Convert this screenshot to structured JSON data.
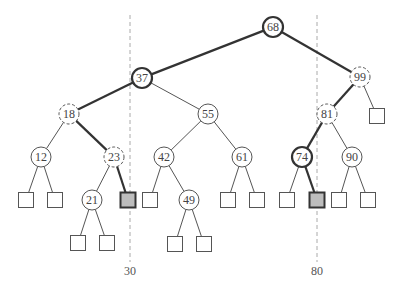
{
  "diagram": {
    "type": "binary-search-tree-range-query",
    "query_range": {
      "low": "30",
      "high": "80"
    },
    "split_lines": [
      {
        "id": "low",
        "x": 130,
        "label": "30"
      },
      {
        "id": "high",
        "x": 317,
        "label": "80"
      }
    ],
    "nodes": [
      {
        "id": "n68",
        "label": "68",
        "x": 273,
        "y": 27,
        "style": "thick"
      },
      {
        "id": "n37",
        "label": "37",
        "x": 142,
        "y": 78,
        "style": "thick"
      },
      {
        "id": "n99",
        "label": "99",
        "x": 360,
        "y": 77,
        "style": "dashed"
      },
      {
        "id": "n18",
        "label": "18",
        "x": 69,
        "y": 114,
        "style": "dashed"
      },
      {
        "id": "n55",
        "label": "55",
        "x": 208,
        "y": 114,
        "style": "normal"
      },
      {
        "id": "n81",
        "label": "81",
        "x": 327,
        "y": 114,
        "style": "dashed"
      },
      {
        "id": "n12",
        "label": "12",
        "x": 41,
        "y": 157,
        "style": "normal"
      },
      {
        "id": "n23",
        "label": "23",
        "x": 114,
        "y": 157,
        "style": "dashed"
      },
      {
        "id": "n42",
        "label": "42",
        "x": 164,
        "y": 157,
        "style": "normal"
      },
      {
        "id": "n61",
        "label": "61",
        "x": 242,
        "y": 157,
        "style": "normal"
      },
      {
        "id": "n74",
        "label": "74",
        "x": 302,
        "y": 157,
        "style": "thick"
      },
      {
        "id": "n90",
        "label": "90",
        "x": 352,
        "y": 157,
        "style": "normal"
      },
      {
        "id": "n21",
        "label": "21",
        "x": 92,
        "y": 200,
        "style": "normal"
      },
      {
        "id": "n49",
        "label": "49",
        "x": 189,
        "y": 200,
        "style": "normal"
      }
    ],
    "leaves": [
      {
        "id": "l99r",
        "x": 377,
        "y": 116,
        "shaded": false
      },
      {
        "id": "l12a",
        "x": 26,
        "y": 200,
        "shaded": false
      },
      {
        "id": "l12b",
        "x": 55,
        "y": 200,
        "shaded": false
      },
      {
        "id": "l23r",
        "x": 128,
        "y": 200,
        "shaded": true
      },
      {
        "id": "l42a",
        "x": 150,
        "y": 200,
        "shaded": false
      },
      {
        "id": "l61a",
        "x": 228,
        "y": 200,
        "shaded": false
      },
      {
        "id": "l61b",
        "x": 257,
        "y": 200,
        "shaded": false
      },
      {
        "id": "l74a",
        "x": 287,
        "y": 200,
        "shaded": false
      },
      {
        "id": "l74b",
        "x": 317,
        "y": 200,
        "shaded": true
      },
      {
        "id": "l90a",
        "x": 339,
        "y": 200,
        "shaded": false
      },
      {
        "id": "l90b",
        "x": 368,
        "y": 200,
        "shaded": false
      },
      {
        "id": "l21a",
        "x": 78,
        "y": 243,
        "shaded": false
      },
      {
        "id": "l21b",
        "x": 107,
        "y": 243,
        "shaded": false
      },
      {
        "id": "l49a",
        "x": 175,
        "y": 244,
        "shaded": false
      },
      {
        "id": "l49b",
        "x": 204,
        "y": 244,
        "shaded": false
      }
    ],
    "edges": [
      {
        "from": "n68",
        "to": "n37",
        "thick": true
      },
      {
        "from": "n68",
        "to": "n99",
        "thick": true
      },
      {
        "from": "n37",
        "to": "n18",
        "thick": true
      },
      {
        "from": "n37",
        "to": "n55",
        "thick": false
      },
      {
        "from": "n99",
        "to": "n81",
        "thick": true
      },
      {
        "from": "n99",
        "to": "l99r",
        "thick": false
      },
      {
        "from": "n18",
        "to": "n12",
        "thick": false
      },
      {
        "from": "n18",
        "to": "n23",
        "thick": true
      },
      {
        "from": "n55",
        "to": "n42",
        "thick": false
      },
      {
        "from": "n55",
        "to": "n61",
        "thick": false
      },
      {
        "from": "n81",
        "to": "n74",
        "thick": true
      },
      {
        "from": "n81",
        "to": "n90",
        "thick": false
      },
      {
        "from": "n12",
        "to": "l12a",
        "thick": false
      },
      {
        "from": "n12",
        "to": "l12b",
        "thick": false
      },
      {
        "from": "n23",
        "to": "n21",
        "thick": false
      },
      {
        "from": "n23",
        "to": "l23r",
        "thick": true
      },
      {
        "from": "n42",
        "to": "l42a",
        "thick": false
      },
      {
        "from": "n42",
        "to": "n49",
        "thick": false
      },
      {
        "from": "n61",
        "to": "l61a",
        "thick": false
      },
      {
        "from": "n61",
        "to": "l61b",
        "thick": false
      },
      {
        "from": "n74",
        "to": "l74a",
        "thick": false
      },
      {
        "from": "n74",
        "to": "l74b",
        "thick": true
      },
      {
        "from": "n90",
        "to": "l90a",
        "thick": false
      },
      {
        "from": "n90",
        "to": "l90b",
        "thick": false
      },
      {
        "from": "n21",
        "to": "l21a",
        "thick": false
      },
      {
        "from": "n21",
        "to": "l21b",
        "thick": false
      },
      {
        "from": "n49",
        "to": "l49a",
        "thick": false
      },
      {
        "from": "n49",
        "to": "l49b",
        "thick": false
      }
    ],
    "colors": {
      "stroke": "#333333",
      "thin_stroke": "#555555",
      "dashed_line": "#aaaaaa",
      "shaded_leaf": "#bdbdbd",
      "text": "#444444"
    }
  }
}
